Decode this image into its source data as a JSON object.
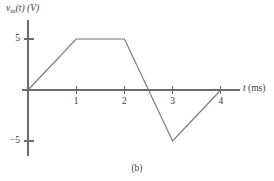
{
  "figure": {
    "caption": "(b)",
    "y_axis_title_var": "v",
    "y_axis_title_sub": "in",
    "y_axis_title_rest": "(t) (V)",
    "x_axis_title_var": "t",
    "x_axis_title_rest": " (ms)"
  },
  "chart_data": {
    "type": "line",
    "title": "",
    "subtitle": "(b)",
    "xlabel": "t (ms)",
    "ylabel": "v_in(t) (V)",
    "xlim": [
      0,
      4.55
    ],
    "ylim": [
      -6.8,
      6.8
    ],
    "grid": false,
    "legend": null,
    "x_ticks": [
      1,
      2,
      3,
      4
    ],
    "x_tick_labels": [
      "1",
      "2",
      "3",
      "4"
    ],
    "y_ticks": [
      5,
      -5
    ],
    "y_tick_labels": [
      "5",
      "−5"
    ],
    "series": [
      {
        "name": "v_in(t)",
        "x": [
          0,
          1,
          2,
          3,
          4
        ],
        "values": [
          0,
          5,
          5,
          -5,
          0
        ],
        "color": "#777777"
      }
    ],
    "zero_crossings": [
      0,
      2.5,
      4
    ],
    "annotations": []
  },
  "geometry": {
    "origin_x": 28,
    "origin_y": 90,
    "px_per_ms": 48.2,
    "px_per_volt": 10.2,
    "x_axis_start": 22,
    "x_axis_end": 240,
    "y_axis_top": 20,
    "y_axis_bottom": 156,
    "tick_half": 4
  }
}
